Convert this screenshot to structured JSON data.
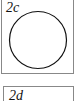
{
  "panels": [
    {
      "label": "2c",
      "shape": "circle"
    },
    {
      "label": "2d",
      "shape": ""
    }
  ]
}
